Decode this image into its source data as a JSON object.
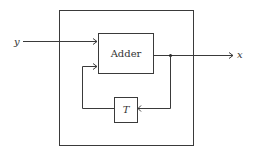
{
  "diagram": {
    "type": "block-diagram",
    "input": {
      "label": "y"
    },
    "output": {
      "label": "x"
    },
    "blocks": [
      {
        "id": "adder",
        "label": "Adder"
      },
      {
        "id": "delay",
        "label": "T"
      }
    ],
    "connections": [
      {
        "from": "y",
        "to": "adder"
      },
      {
        "from": "adder",
        "to": "x"
      },
      {
        "from": "adder-output-junction",
        "to": "delay"
      },
      {
        "from": "delay",
        "to": "adder"
      }
    ],
    "colors": {
      "line": "#3a3a3a",
      "background": "#ffffff"
    }
  }
}
